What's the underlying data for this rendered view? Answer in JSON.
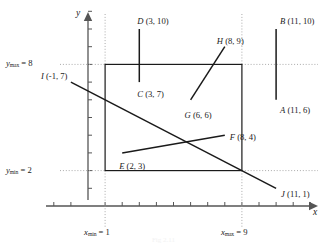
{
  "figure": {
    "type": "geometry-diagram",
    "background": "#ffffff",
    "line_color": "#1a1a1a",
    "axis_color": "#555555",
    "guide_color": "#aaaaaa",
    "width": 327,
    "height": 248
  },
  "axes": {
    "x_label": "x",
    "y_label": "y",
    "origin": {
      "x": 88,
      "y": 206
    },
    "unit_x": 17.1,
    "unit_y": 17.7,
    "x_ticks": [
      -2,
      -1,
      1,
      2,
      3,
      4,
      5,
      6,
      7,
      8,
      9,
      10,
      11,
      12,
      13
    ],
    "y_ticks": [
      1,
      2,
      3,
      4,
      5,
      6,
      7,
      8,
      9,
      10,
      11
    ]
  },
  "bounds": {
    "x_min_label_prefix": "x",
    "x_min_label_sub": "min",
    "x_min_label_value": "= 1",
    "x_max_label_prefix": "x",
    "x_max_label_sub": "max",
    "x_max_label_value": "= 9",
    "y_min_label_prefix": "y",
    "y_min_label_sub": "min",
    "y_min_label_value": "= 2",
    "y_max_label_prefix": "y",
    "y_max_label_sub": "max",
    "y_max_label_value": "= 8",
    "x_min": 1,
    "x_max": 9,
    "y_min": 2,
    "y_max": 8
  },
  "points": [
    {
      "id": "A",
      "label": "A (11, 6)",
      "x": 11,
      "y": 6
    },
    {
      "id": "B",
      "label": "B (11, 10)",
      "x": 11,
      "y": 10
    },
    {
      "id": "C",
      "label": "C (3, 7)",
      "x": 3,
      "y": 7
    },
    {
      "id": "D",
      "label": "D (3, 10)",
      "x": 3,
      "y": 10
    },
    {
      "id": "E",
      "label": "E (2, 3)",
      "x": 2,
      "y": 3
    },
    {
      "id": "F",
      "label": "F (8, 4)",
      "x": 8,
      "y": 4
    },
    {
      "id": "G",
      "label": "G (6, 6)",
      "x": 6,
      "y": 6
    },
    {
      "id": "H",
      "label": "H (8, 9)",
      "x": 8,
      "y": 9
    },
    {
      "id": "I",
      "label": "I (-1, 7)",
      "x": -1,
      "y": 7
    },
    {
      "id": "J",
      "label": "J (11, 1)",
      "x": 11,
      "y": 1
    }
  ],
  "segments": [
    {
      "id": "AB",
      "from": "A",
      "to": "B",
      "name": "segment-ab"
    },
    {
      "id": "CD",
      "from": "C",
      "to": "D",
      "name": "segment-cd"
    },
    {
      "id": "EF",
      "from": "E",
      "to": "F",
      "name": "segment-ef"
    },
    {
      "id": "GH",
      "from": "G",
      "to": "H",
      "name": "segment-gh"
    },
    {
      "id": "IJ",
      "from": "I",
      "to": "J",
      "name": "segment-ij"
    }
  ],
  "clip_rectangle": {
    "x_min": 1,
    "y_min": 2,
    "x_max": 9,
    "y_max": 8
  },
  "chart_data": {
    "type": "scatter",
    "title": "",
    "xlabel": "x",
    "ylabel": "y",
    "xlim": [
      -2.5,
      13.5
    ],
    "ylim": [
      -0.6,
      11.5
    ],
    "grid": false,
    "legend": "none",
    "annotations": [
      "x_min = 1",
      "x_max = 9",
      "y_min = 2",
      "y_max = 8"
    ],
    "series": [
      {
        "name": "line-segments",
        "points": [
          {
            "label": "A (11, 6)",
            "x": 11,
            "y": 6
          },
          {
            "label": "B (11, 10)",
            "x": 11,
            "y": 10
          },
          {
            "label": "C (3, 7)",
            "x": 3,
            "y": 7
          },
          {
            "label": "D (3, 10)",
            "x": 3,
            "y": 10
          },
          {
            "label": "E (2, 3)",
            "x": 2,
            "y": 3
          },
          {
            "label": "F (8, 4)",
            "x": 8,
            "y": 4
          },
          {
            "label": "G (6, 6)",
            "x": 6,
            "y": 6
          },
          {
            "label": "H (8, 9)",
            "x": 8,
            "y": 9
          },
          {
            "label": "I (-1, 7)",
            "x": -1,
            "y": 7
          },
          {
            "label": "J (11, 1)",
            "x": 11,
            "y": 1
          }
        ]
      }
    ]
  },
  "caption": "Fig 2.11"
}
